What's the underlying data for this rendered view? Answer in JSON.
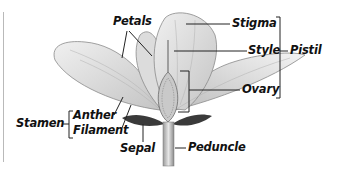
{
  "diagram": {
    "labels": {
      "petals": "Petals",
      "stigma": "Stigma",
      "style": "Style",
      "pistil": "Pistil",
      "ovary": "Ovary",
      "stamen": "Stamen",
      "anther": "Anther",
      "filament": "Filament",
      "sepal": "Sepal",
      "peduncle": "Peduncle"
    },
    "groups": {
      "pistil": [
        "Stigma",
        "Style",
        "Ovary"
      ],
      "stamen": [
        "Anther",
        "Filament"
      ]
    },
    "colors": {
      "petal_fill": "#e2e2e2",
      "petal_stroke": "#8a8a8a",
      "leader_line": "#222222",
      "sepal_dark": "#3a3a3a"
    }
  }
}
